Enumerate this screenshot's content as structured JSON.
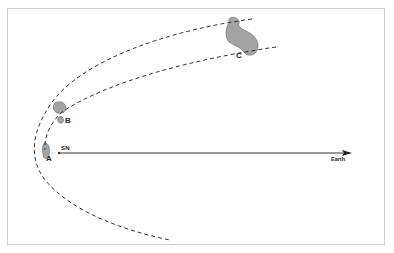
{
  "diagram": {
    "type": "light-echo geometry",
    "labels": {
      "point_a": "A",
      "point_b": "B",
      "point_c": "C",
      "source": "SN",
      "destination": "Earth"
    },
    "elements": {
      "outer_parabola": "dashed curve",
      "inner_parabola": "dashed curve",
      "line_of_sight": "arrow from SN to Earth",
      "clouds": [
        "cloud-a",
        "cloud-b",
        "cloud-c"
      ]
    },
    "colors": {
      "ink": "#222222",
      "frame": "#cfcfcf",
      "background": "#ffffff"
    }
  }
}
